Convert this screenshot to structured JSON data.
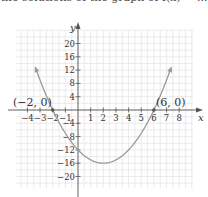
{
  "caption": "the solutions of the graph of f(x) = ...",
  "chart_data": {
    "type": "line",
    "title": "",
    "xlabel": "x",
    "ylabel": "y",
    "xlim": [
      -4.5,
      9
    ],
    "ylim": [
      -23,
      24
    ],
    "grid": true,
    "x_ticks": [
      -4,
      -3,
      -2,
      -1,
      1,
      2,
      3,
      4,
      5,
      6,
      7,
      8
    ],
    "x_tick_labels": [
      "−4",
      "−3",
      "−2",
      "−1",
      "1",
      "2",
      "3",
      "4",
      "5",
      "6",
      "7",
      "8"
    ],
    "y_ticks": [
      20,
      16,
      12,
      8,
      4,
      -4,
      -8,
      -12,
      -16,
      -20
    ],
    "y_tick_labels": [
      "20",
      "16",
      "12",
      "8",
      "4",
      "−4",
      "−8",
      "−12",
      "−16",
      "−20"
    ],
    "series": [
      {
        "name": "parabola",
        "equation": "y = (x + 2)(x − 6) = x² − 4x − 12",
        "x": [
          -3.3,
          -2,
          -1,
          0,
          1,
          2,
          3,
          4,
          5,
          6,
          7.3
        ],
        "y": [
          9.8,
          0,
          -7,
          -12,
          -15,
          -16,
          -15,
          -12,
          -7,
          0,
          9.9
        ]
      }
    ],
    "annotations": [
      {
        "text": "(−2, 0)",
        "x": -2,
        "y": 0
      },
      {
        "text": "(6, 0)",
        "x": 6,
        "y": 0
      }
    ],
    "vertex": {
      "x": 2,
      "y": -16
    }
  },
  "labels": {
    "x_axis": "x",
    "y_axis": "y",
    "point_left": "(−2, 0)",
    "point_right": "(6, 0)"
  }
}
